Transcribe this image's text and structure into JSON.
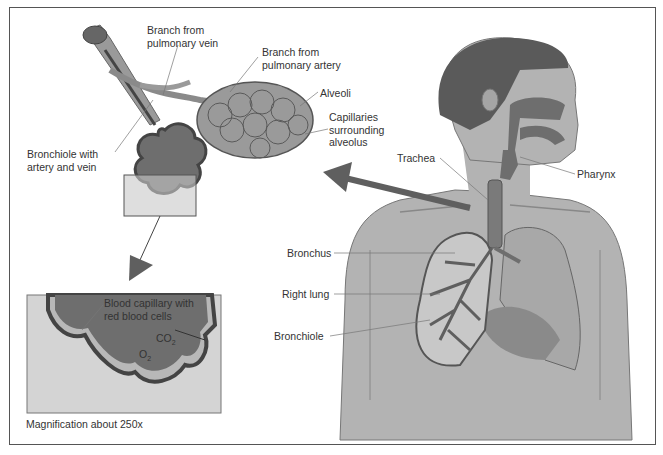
{
  "figure": {
    "type": "anatomical-diagram",
    "colors": {
      "background": "#ffffff",
      "frame": "#555555",
      "skin": "#b3b3b3",
      "dark_tissue": "#6e6e6e",
      "hair": "#5a5a5a",
      "lung": "#a8a8a8",
      "arrow": "#5f5f5f",
      "inset_bg": "#d4d4d4",
      "label_text": "#333333"
    }
  },
  "labels": {
    "branch_vein": "Branch from\npulmonary vein",
    "branch_artery": "Branch from\npulmonary artery",
    "alveoli": "Alveoli",
    "capillaries": "Capillaries\nsurrounding\nalveolus",
    "bronchiole_artery_vein": "Bronchiole with\nartery and vein",
    "trachea": "Trachea",
    "pharynx": "Pharynx",
    "bronchus": "Bronchus",
    "right_lung": "Right lung",
    "bronchiole": "Bronchiole",
    "blood_capillary": "Blood capillary with\nred blood cells",
    "co2": "CO",
    "co2_sub": "2",
    "o2": "O",
    "o2_sub": "2",
    "magnification": "Magnification about 250x"
  }
}
